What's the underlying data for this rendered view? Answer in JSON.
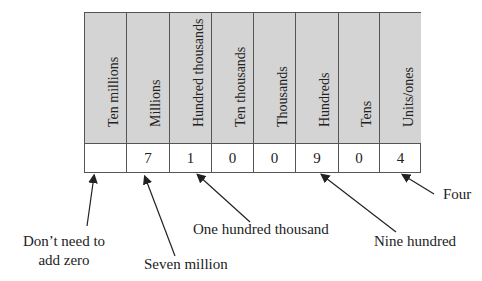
{
  "place_value_table": {
    "columns": [
      {
        "header": "Ten millions",
        "digit": ""
      },
      {
        "header": "Millions",
        "digit": "7"
      },
      {
        "header": "Hundred thousands",
        "digit": "1"
      },
      {
        "header": "Ten thousands",
        "digit": "0"
      },
      {
        "header": "Thousands",
        "digit": "0"
      },
      {
        "header": "Hundreds",
        "digit": "9"
      },
      {
        "header": "Tens",
        "digit": "0"
      },
      {
        "header": "Units/ones",
        "digit": "4"
      }
    ]
  },
  "annotations": {
    "dont_need_zero_line1": "Don’t need to",
    "dont_need_zero_line2": "add zero",
    "seven_million": "Seven million",
    "one_hundred_thousand": "One hundred thousand",
    "nine_hundred": "Nine hundred",
    "four": "Four"
  },
  "colors": {
    "header_fill": "#d4d4d4",
    "border": "#555555"
  }
}
